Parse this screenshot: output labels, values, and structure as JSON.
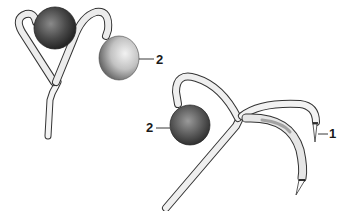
{
  "figure": {
    "type": "biological line illustration",
    "specimens": [
      {
        "id": "left",
        "description": "branching hypha with two spherical bodies"
      },
      {
        "id": "right",
        "description": "branching hypha with one spherical body and two hyphal tips"
      }
    ],
    "labels": [
      {
        "text": "2",
        "target": "spherical body (left specimen)",
        "x": 156,
        "y": 53
      },
      {
        "text": "2",
        "target": "spherical body (right specimen)",
        "x": 146,
        "y": 121
      },
      {
        "text": "1",
        "target": "hyphal tip",
        "x": 329,
        "y": 126
      }
    ],
    "colors": {
      "ink": "#222222",
      "shade_dark": "#3a3a3a",
      "shade_light": "#cfcfcf",
      "background": "#ffffff"
    }
  }
}
